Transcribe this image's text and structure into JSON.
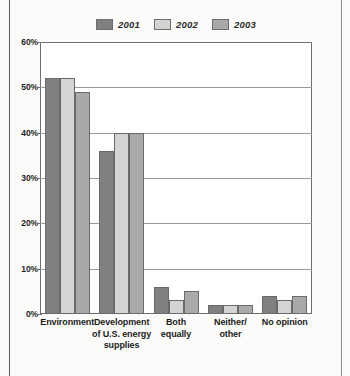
{
  "chart_data": {
    "type": "bar",
    "title": "",
    "xlabel": "",
    "ylabel": "",
    "ylim": [
      0,
      60
    ],
    "yticks": [
      "0%",
      "10%",
      "20%",
      "30%",
      "40%",
      "50%",
      "60%"
    ],
    "ytick_values": [
      0,
      10,
      20,
      30,
      40,
      50,
      60
    ],
    "grid": true,
    "legend_position": "top-center",
    "categories": [
      "Environment",
      "Development of U.S. energy supplies",
      "Both equally",
      "Neither/ other",
      "No opinion"
    ],
    "category_lines": [
      [
        "Environment"
      ],
      [
        "Development",
        "of U.S. energy",
        "supplies"
      ],
      [
        "Both",
        "equally"
      ],
      [
        "Neither/",
        "other"
      ],
      [
        "No opinion"
      ]
    ],
    "series": [
      {
        "name": "2001",
        "color": "#808080",
        "values": [
          52,
          36,
          6,
          2,
          4
        ]
      },
      {
        "name": "2002",
        "color": "#d4d4d4",
        "values": [
          52,
          40,
          3,
          2,
          3
        ]
      },
      {
        "name": "2003",
        "color": "#a9a9a9",
        "values": [
          49,
          40,
          5,
          2,
          4
        ]
      }
    ]
  },
  "legend": {
    "entries": [
      {
        "label": "2001"
      },
      {
        "label": "2002"
      },
      {
        "label": "2003"
      }
    ]
  }
}
